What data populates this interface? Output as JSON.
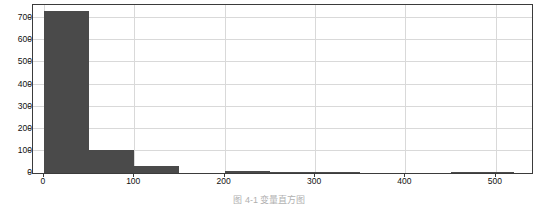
{
  "caption": "图 4-1  变量直方图",
  "colors": {
    "bar_fill": "#4a4a4a",
    "grid": "#d9d9d9",
    "frame": "#3b3b3b",
    "background": "#ffffff",
    "tick_text": "#111111"
  },
  "chart_data": {
    "type": "bar",
    "title": "",
    "subtitle": "",
    "xlabel": "",
    "ylabel": "",
    "grid": true,
    "legend": false,
    "legend_position": "none",
    "xlim": [
      -12,
      540
    ],
    "ylim": [
      0,
      760
    ],
    "xticks": [
      0,
      100,
      200,
      300,
      400,
      500
    ],
    "xtick_labels": [
      "0",
      "100",
      "200",
      "300",
      "400",
      "500"
    ],
    "yticks": [
      0,
      100,
      200,
      300,
      400,
      500,
      600,
      700
    ],
    "ytick_labels": [
      "0",
      "100",
      "200",
      "300",
      "400",
      "500",
      "600",
      "700"
    ],
    "bin_edges": [
      0,
      50,
      100,
      150,
      200,
      250,
      300,
      350,
      400,
      450,
      500,
      520
    ],
    "categories": [
      "0-50",
      "50-100",
      "100-150",
      "150-200",
      "200-250",
      "250-300",
      "300-350",
      "350-400",
      "400-450",
      "450-500",
      "500-520"
    ],
    "values": [
      735,
      105,
      32,
      0,
      8,
      3,
      2,
      0,
      0,
      3,
      2
    ],
    "annotations": []
  }
}
